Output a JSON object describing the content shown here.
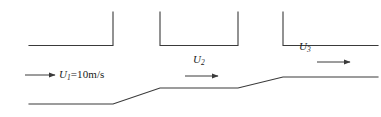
{
  "figure": {
    "type": "duct-flow-schematic",
    "background_color": "#ffffff",
    "line_color": "#3a3a3a",
    "text_color": "#1a1a1a"
  },
  "labels": {
    "u1": {
      "symbol": "U",
      "subscript": "1",
      "equals": "=10m/s",
      "full": "U1=10m/s"
    },
    "u2": {
      "symbol": "U",
      "subscript": "2",
      "equals": "",
      "full": "U2"
    },
    "u3": {
      "symbol": "U",
      "subscript": "3",
      "equals": "",
      "full": "U3"
    }
  },
  "geometry": {
    "upper_wall_left": {
      "name": "left-ceiling-segment",
      "horizontal": {
        "x1": 29,
        "y1": 45.5,
        "x2": 113,
        "y2": 45.5
      },
      "vertical": {
        "x1": 113,
        "y1": 45.5,
        "x2": 113,
        "y2": 12
      }
    },
    "upper_wall_middle": {
      "name": "middle-ceiling-segment",
      "left_riser": {
        "x1": 160,
        "y1": 12,
        "x2": 160,
        "y2": 45.5
      },
      "horizontal": {
        "x1": 160,
        "y1": 45.5,
        "x2": 238,
        "y2": 45.5
      },
      "right_riser": {
        "x1": 238,
        "y1": 45.5,
        "x2": 238,
        "y2": 12
      }
    },
    "upper_wall_right": {
      "name": "right-ceiling-segment",
      "vertical": {
        "x1": 283,
        "y1": 12,
        "x2": 283,
        "y2": 45.5
      },
      "horizontal": {
        "x1": 283,
        "y1": 45.5,
        "x2": 378,
        "y2": 45.5
      }
    },
    "lower_wall": {
      "name": "stepped-floor-profile",
      "points": "29,104 113,104 160,88 238,88 283,77 378,77"
    },
    "arrows": {
      "u1": {
        "x1": 25,
        "y1": 75,
        "x2": 56,
        "y2": 75
      },
      "u2": {
        "x1": 185,
        "y1": 76,
        "x2": 219,
        "y2": 76
      },
      "u3": {
        "x1": 317,
        "y1": 62,
        "x2": 351,
        "y2": 62
      }
    }
  }
}
